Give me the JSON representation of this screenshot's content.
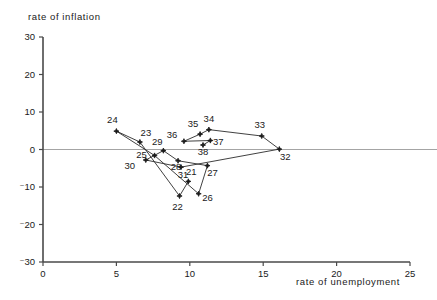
{
  "chart_data": {
    "type": "scatter",
    "title": "",
    "xlabel": "rate of unemployment",
    "ylabel": "rate of inflation",
    "xlim": [
      0,
      25
    ],
    "ylim": [
      -30,
      30
    ],
    "xticks": [
      "0",
      "5",
      "10",
      "15",
      "20",
      "25"
    ],
    "yticks": [
      "30",
      "20",
      "10",
      "0",
      "⁻10",
      "⁻20",
      "⁻30"
    ],
    "xtick_values": [
      0,
      5,
      10,
      15,
      20,
      25
    ],
    "ytick_values": [
      30,
      20,
      10,
      0,
      -10,
      -20,
      -30
    ],
    "grid": false,
    "legend": null,
    "connected": true,
    "marker_style": "star",
    "series": [
      {
        "name": "Phillips curve trajectory",
        "points": [
          {
            "label": "21",
            "x": 9.9,
            "y": -8.5
          },
          {
            "label": "22",
            "x": 9.3,
            "y": -12.4
          },
          {
            "label": "23",
            "x": 6.6,
            "y": 2.0
          },
          {
            "label": "24",
            "x": 5.0,
            "y": 4.9
          },
          {
            "label": "25",
            "x": 7.6,
            "y": -1.6
          },
          {
            "label": "26",
            "x": 10.6,
            "y": -11.8
          },
          {
            "label": "27",
            "x": 11.2,
            "y": -4.3
          },
          {
            "label": "28",
            "x": 9.2,
            "y": -3.0
          },
          {
            "label": "29",
            "x": 8.2,
            "y": -0.3
          },
          {
            "label": "30",
            "x": 7.0,
            "y": -2.8
          },
          {
            "label": "31",
            "x": 9.4,
            "y": -4.7
          },
          {
            "label": "32",
            "x": 16.1,
            "y": 0.1
          },
          {
            "label": "33",
            "x": 14.9,
            "y": 3.6
          },
          {
            "label": "34",
            "x": 11.3,
            "y": 5.3
          },
          {
            "label": "35",
            "x": 10.7,
            "y": 4.1
          },
          {
            "label": "36",
            "x": 9.6,
            "y": 2.2
          },
          {
            "label": "37",
            "x": 11.4,
            "y": 2.4
          },
          {
            "label": "38",
            "x": 10.9,
            "y": 1.2
          }
        ],
        "order": [
          "21",
          "22",
          "23",
          "24",
          "25",
          "26",
          "27",
          "28",
          "29",
          "30",
          "31",
          "32",
          "33",
          "34",
          "35",
          "36",
          "37",
          "38"
        ]
      }
    ],
    "label_offsets": {
      "21": [
        3,
        -6
      ],
      "22": [
        -2,
        14
      ],
      "23": [
        6,
        -6
      ],
      "24": [
        -4,
        -8
      ],
      "25": [
        -13,
        2
      ],
      "26": [
        9,
        7
      ],
      "27": [
        5,
        10
      ],
      "28": [
        -2,
        9
      ],
      "29": [
        -6,
        -6
      ],
      "30": [
        -16,
        9
      ],
      "31": [
        2,
        11
      ],
      "32": [
        6,
        11
      ],
      "33": [
        -2,
        -8
      ],
      "34": [
        0,
        -8
      ],
      "35": [
        -7,
        -7
      ],
      "36": [
        -12,
        -3
      ],
      "37": [
        8,
        4
      ],
      "38": [
        0,
        10
      ]
    },
    "colors": {
      "line": "#2b2b2b",
      "marker": "#1a1a1a",
      "axis": "#4a4a4a",
      "zero_line": "#9a9a9a",
      "background": "#ffffff"
    }
  }
}
